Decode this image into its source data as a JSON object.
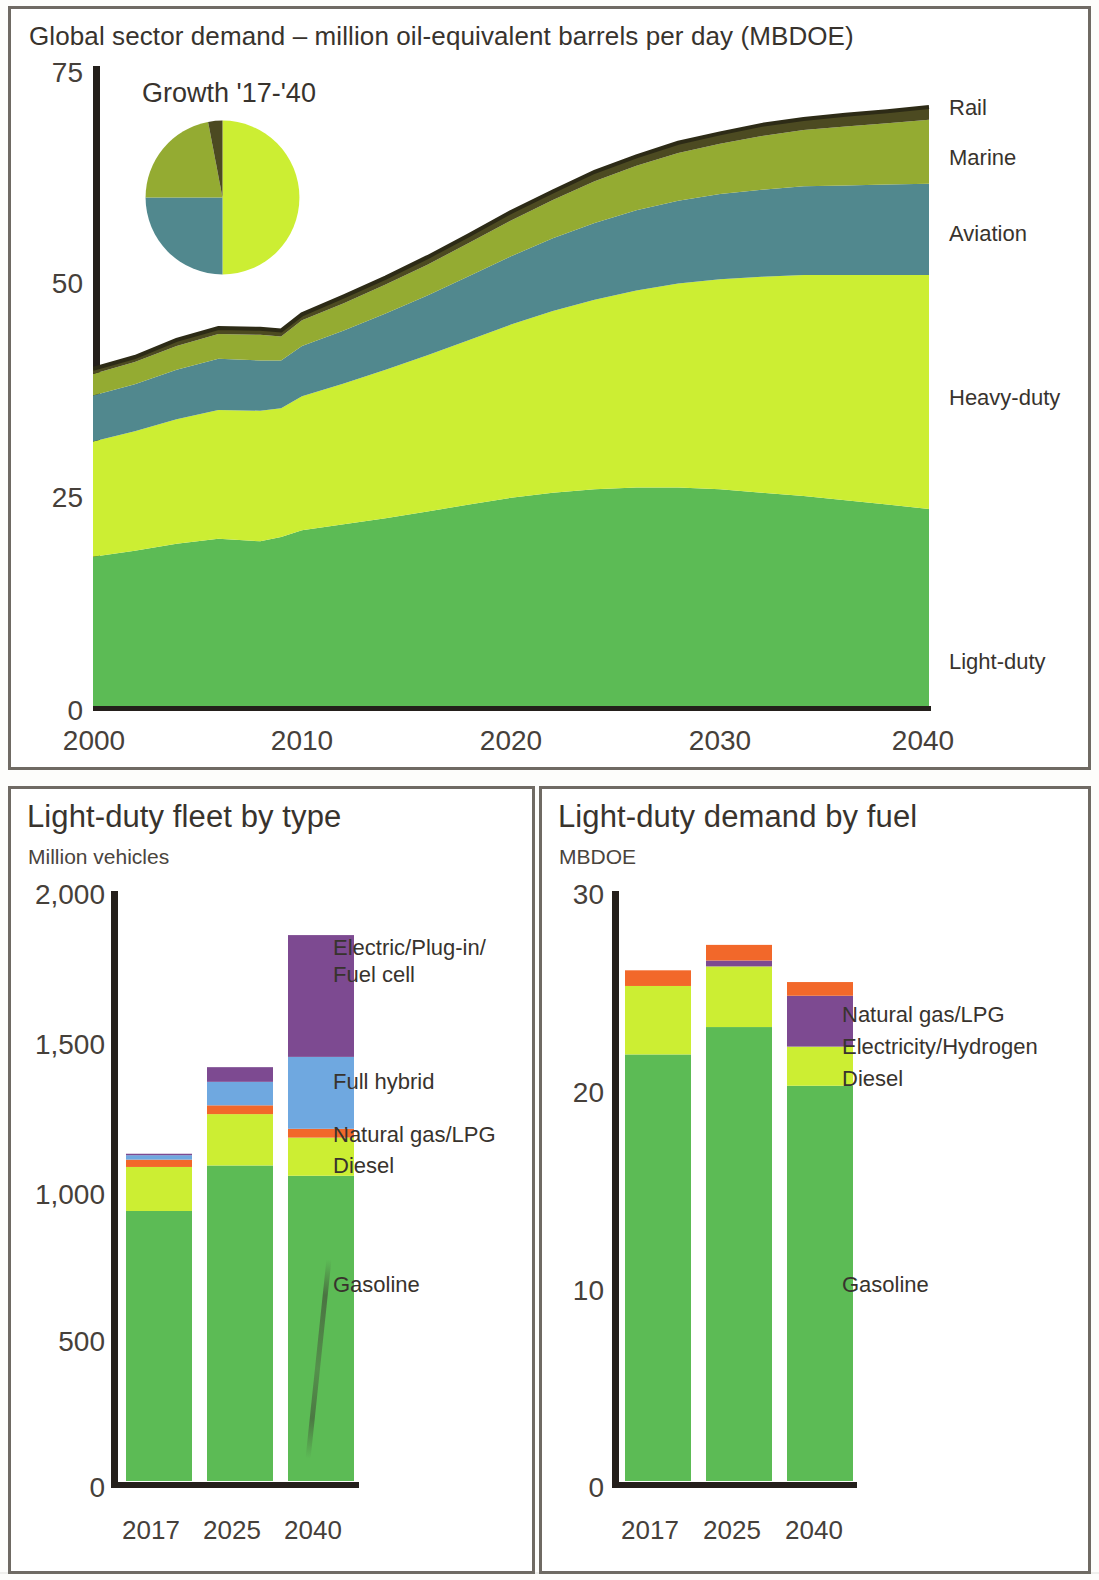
{
  "top_panel": {
    "title": "Global sector demand – million oil-equivalent barrels per day (MBDOE)",
    "pie_title": "Growth '17-'40",
    "y_ticks": [
      "75",
      "50",
      "25",
      "0"
    ],
    "x_ticks": [
      "2000",
      "2010",
      "2020",
      "2030",
      "2040"
    ],
    "series_labels": {
      "rail": "Rail",
      "marine": "Marine",
      "aviation": "Aviation",
      "heavy": "Heavy-duty",
      "light": "Light-duty"
    }
  },
  "bottom_left": {
    "title": "Light-duty fleet by type",
    "subtitle": "Million vehicles",
    "y_ticks": [
      "2,000",
      "1,500",
      "1,000",
      "500",
      "0"
    ],
    "x_ticks": [
      "2017",
      "2025",
      "2040"
    ],
    "labels": {
      "electric": "Electric/Plug-in/",
      "electric2": "Fuel cell",
      "hybrid": "Full hybrid",
      "ng": "Natural gas/LPG",
      "diesel": "Diesel",
      "gasoline": "Gasoline"
    }
  },
  "bottom_right": {
    "title": "Light-duty demand by fuel",
    "subtitle": "MBDOE",
    "y_ticks": [
      "30",
      "20",
      "10",
      "0"
    ],
    "x_ticks": [
      "2017",
      "2025",
      "2040"
    ],
    "labels": {
      "ng": "Natural gas/LPG",
      "elec": "Electricity/Hydrogen",
      "diesel": "Diesel",
      "gasoline": "Gasoline"
    }
  },
  "colors": {
    "light_duty": "#5cbb55",
    "heavy_duty": "#ccee33",
    "aviation": "#51888e",
    "marine": "#94ab32",
    "rail": "#4c4a21",
    "gasoline": "#5cbb55",
    "diesel": "#ccee33",
    "natural_gas": "#f2682a",
    "full_hybrid": "#6fa8e0",
    "electric": "#7d4a91",
    "axis": "#241f1b",
    "text": "#38332d"
  },
  "chart_data": [
    {
      "type": "area",
      "id": "global-sector-demand",
      "title": "Global sector demand – million oil-equivalent barrels per day (MBDOE)",
      "xlabel": "",
      "ylabel": "MBDOE",
      "xlim": [
        2000,
        2040
      ],
      "ylim": [
        0,
        75
      ],
      "grid": false,
      "legend": "right-inline",
      "stacked": true,
      "x": [
        2000,
        2002,
        2004,
        2006,
        2008,
        2009,
        2010,
        2012,
        2014,
        2016,
        2018,
        2020,
        2022,
        2024,
        2026,
        2028,
        2030,
        2032,
        2034,
        2036,
        2038,
        2040
      ],
      "series": [
        {
          "name": "Light-duty",
          "color": "#5cbb55",
          "values": [
            17.5,
            18.2,
            19.0,
            19.6,
            19.3,
            19.8,
            20.6,
            21.3,
            22.0,
            22.8,
            23.6,
            24.4,
            25.0,
            25.4,
            25.6,
            25.6,
            25.4,
            25.0,
            24.6,
            24.1,
            23.6,
            23.1
          ]
        },
        {
          "name": "Heavy-duty",
          "color": "#ccee33",
          "values": [
            13.5,
            14.0,
            14.6,
            15.1,
            15.3,
            15.1,
            15.7,
            16.5,
            17.4,
            18.3,
            19.3,
            20.3,
            21.3,
            22.2,
            23.1,
            23.9,
            24.6,
            25.3,
            25.9,
            26.4,
            26.9,
            27.4
          ]
        },
        {
          "name": "Aviation",
          "color": "#51888e",
          "values": [
            5.4,
            5.5,
            5.8,
            6.0,
            5.9,
            5.6,
            5.9,
            6.2,
            6.6,
            7.0,
            7.5,
            8.0,
            8.5,
            9.0,
            9.4,
            9.7,
            10.0,
            10.2,
            10.4,
            10.5,
            10.6,
            10.7
          ]
        },
        {
          "name": "Marine",
          "color": "#94ab32",
          "values": [
            2.5,
            2.6,
            2.8,
            2.9,
            3.0,
            2.8,
            3.0,
            3.2,
            3.4,
            3.6,
            3.9,
            4.2,
            4.5,
            4.9,
            5.2,
            5.6,
            5.9,
            6.3,
            6.6,
            6.9,
            7.2,
            7.5
          ]
        },
        {
          "name": "Rail",
          "color": "#4c4a21",
          "values": [
            0.6,
            0.6,
            0.7,
            0.7,
            0.7,
            0.7,
            0.7,
            0.8,
            0.8,
            0.9,
            0.9,
            1.0,
            1.0,
            1.1,
            1.1,
            1.2,
            1.2,
            1.3,
            1.3,
            1.4,
            1.4,
            1.5
          ]
        }
      ],
      "totals_approx": {
        "2000": 39.5,
        "2020": 57.9,
        "2040": 70.2
      }
    },
    {
      "type": "pie",
      "id": "growth-17-40",
      "title": "Growth '17-'40",
      "labels": [
        "Heavy-duty",
        "Aviation",
        "Marine",
        "Rail"
      ],
      "colors": [
        "#ccee33",
        "#51888e",
        "#94ab32",
        "#4c4a21"
      ],
      "values": [
        50,
        25,
        22,
        3
      ]
    },
    {
      "type": "bar",
      "id": "light-duty-fleet-by-type",
      "title": "Light-duty fleet by type",
      "ylabel": "Million vehicles",
      "categories": [
        "2017",
        "2025",
        "2040"
      ],
      "ylim": [
        0,
        2000
      ],
      "yticks": [
        0,
        500,
        1000,
        1500,
        2000
      ],
      "stacked": true,
      "series": [
        {
          "name": "Gasoline",
          "color": "#5cbb55",
          "values": [
            920,
            1075,
            1040
          ]
        },
        {
          "name": "Diesel",
          "color": "#ccee33",
          "values": [
            150,
            175,
            130
          ]
        },
        {
          "name": "Natural gas/LPG",
          "color": "#f2682a",
          "values": [
            25,
            30,
            30
          ]
        },
        {
          "name": "Full hybrid",
          "color": "#6fa8e0",
          "values": [
            15,
            80,
            245
          ]
        },
        {
          "name": "Electric/Plug-in/Fuel cell",
          "color": "#7d4a91",
          "values": [
            5,
            50,
            415
          ]
        }
      ],
      "totals": [
        1115,
        1410,
        1860
      ]
    },
    {
      "type": "bar",
      "id": "light-duty-demand-by-fuel",
      "title": "Light-duty demand by fuel",
      "ylabel": "MBDOE",
      "categories": [
        "2017",
        "2025",
        "2040"
      ],
      "ylim": [
        0,
        30
      ],
      "yticks": [
        0,
        10,
        20,
        30
      ],
      "stacked": true,
      "series": [
        {
          "name": "Gasoline",
          "color": "#5cbb55",
          "values": [
            21.8,
            23.2,
            20.2
          ]
        },
        {
          "name": "Diesel",
          "color": "#ccee33",
          "values": [
            3.5,
            3.1,
            2.0
          ]
        },
        {
          "name": "Electricity/Hydrogen",
          "color": "#7d4a91",
          "values": [
            0.0,
            0.3,
            2.6
          ]
        },
        {
          "name": "Natural gas/LPG",
          "color": "#f2682a",
          "values": [
            0.8,
            0.8,
            0.7
          ]
        }
      ],
      "totals": [
        26.1,
        27.4,
        25.5
      ]
    }
  ]
}
